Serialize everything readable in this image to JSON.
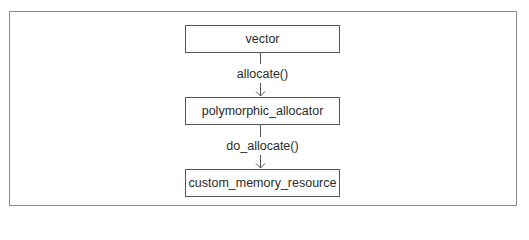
{
  "diagram": {
    "nodes": [
      {
        "id": "vector",
        "label": "vector"
      },
      {
        "id": "polymorphic_allocator",
        "label": "polymorphic_allocator"
      },
      {
        "id": "custom_memory_resource",
        "label": "custom_memory_resource"
      }
    ],
    "edges": [
      {
        "from": "vector",
        "to": "polymorphic_allocator",
        "label": "allocate()"
      },
      {
        "from": "polymorphic_allocator",
        "to": "custom_memory_resource",
        "label": "do_allocate()"
      }
    ],
    "colors": {
      "border": "#555555",
      "frame": "#8a8a8a",
      "text": "#2b2b2b"
    }
  }
}
